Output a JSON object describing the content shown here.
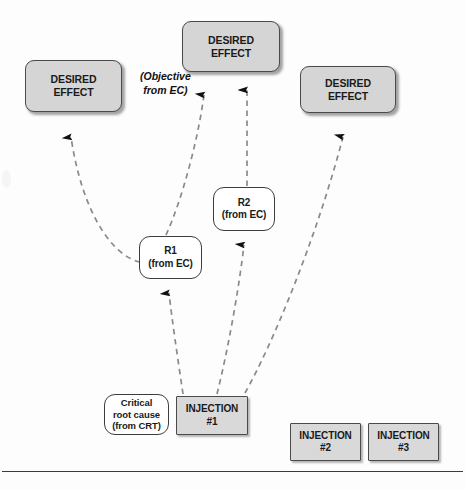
{
  "diagram": {
    "colors": {
      "shaded_fill": "#d5d5d5",
      "injection_fill": "#d9d9d9",
      "entity_fill": "#ffffff",
      "border": "#4a4a4a",
      "arrow": "#7a7a7a",
      "arrowhead": "#111111",
      "text": "#1a1a1a"
    },
    "nodes": [
      {
        "id": "de_left",
        "label": "DESIRED\nEFFECT",
        "line1": "DESIRED",
        "line2": "EFFECT",
        "line3": "",
        "shape": "rounded-shaded",
        "x": 25,
        "y": 60,
        "w": 97,
        "h": 52
      },
      {
        "id": "de_top",
        "label": "DESIRED\nEFFECT",
        "line1": "DESIRED",
        "line2": "EFFECT",
        "line3": "",
        "shape": "rounded-shaded",
        "x": 182,
        "y": 21,
        "w": 98,
        "h": 51
      },
      {
        "id": "de_right",
        "label": "DESIRED\nEFFECT",
        "line1": "DESIRED",
        "line2": "EFFECT",
        "line3": "",
        "shape": "rounded-shaded",
        "x": 300,
        "y": 66,
        "w": 96,
        "h": 47
      },
      {
        "id": "r2",
        "label": "R2\n(from EC)",
        "line1": "R2",
        "line2": "(from EC)",
        "line3": "",
        "shape": "rounded-white",
        "x": 213,
        "y": 187,
        "w": 62,
        "h": 44
      },
      {
        "id": "r1",
        "label": "R1\n(from EC)",
        "line1": "R1",
        "line2": "(from EC)",
        "line3": "",
        "shape": "rounded-white",
        "x": 139,
        "y": 236,
        "w": 63,
        "h": 43
      },
      {
        "id": "crt",
        "label": "Critical\nroot cause\n(from CRT)",
        "line1": "Critical",
        "line2": "root cause",
        "line3": "(from CRT)",
        "shape": "rounded-white",
        "x": 104,
        "y": 394,
        "w": 65,
        "h": 41
      },
      {
        "id": "inj1",
        "label": "INJECTION\n#1",
        "line1": "INJECTION",
        "line2": "#1",
        "line3": "",
        "shape": "square-shaded",
        "x": 176,
        "y": 396,
        "w": 72,
        "h": 39
      },
      {
        "id": "inj2",
        "label": "INJECTION\n#2",
        "line1": "INJECTION",
        "line2": "#2",
        "line3": "",
        "shape": "square-shaded",
        "x": 290,
        "y": 423,
        "w": 71,
        "h": 38
      },
      {
        "id": "inj3",
        "label": "INJECTION\n#3",
        "line1": "INJECTION",
        "line2": "#3",
        "line3": "",
        "shape": "square-shaded",
        "x": 368,
        "y": 423,
        "w": 71,
        "h": 38
      }
    ],
    "annotations": [
      {
        "id": "objective_note",
        "line1": "(Objective",
        "line2": "from EC)",
        "x": 140,
        "y": 70
      }
    ],
    "edges": [
      {
        "id": "r1_to_de_left",
        "from": "r1",
        "to": "de_left",
        "style": "dashed-curved-arrow"
      },
      {
        "id": "r1_to_de_top",
        "from": "r1",
        "to": "de_top",
        "style": "dashed-curved-arrow"
      },
      {
        "id": "r2_to_de_top",
        "from": "r2",
        "to": "de_top",
        "style": "dashed-straight-arrow"
      },
      {
        "id": "inj1_to_r1",
        "from": "inj1",
        "to": "r1",
        "style": "dashed-straight-arrow"
      },
      {
        "id": "inj1_to_r2",
        "from": "inj1",
        "to": "r2",
        "style": "dashed-straight-arrow"
      },
      {
        "id": "inj1_to_de_right",
        "from": "inj1",
        "to": "de_right",
        "style": "dashed-curved-arrow"
      }
    ]
  }
}
